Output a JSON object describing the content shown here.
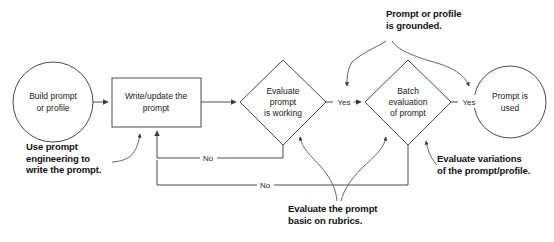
{
  "diagram": {
    "nodes": {
      "start": "Build prompt\nor profile",
      "start_line1": "Build prompt",
      "start_line2": "or profile",
      "write": "Write/update the\nprompt",
      "write_line1": "Write/update the",
      "write_line2": "prompt",
      "eval1_line1": "Evaluate",
      "eval1_line2": "prompt",
      "eval1_line3": "is working",
      "eval2_line1": "Batch",
      "eval2_line2": "evaluation",
      "eval2_line3": "of prompt",
      "end_line1": "Prompt is",
      "end_line2": "used"
    },
    "edge_labels": {
      "yes1": "Yes",
      "yes2": "Yes",
      "no1": "No",
      "no2": "No"
    },
    "callouts": {
      "prompt_engineering_line1": "Use prompt",
      "prompt_engineering_line2": "engineering to",
      "prompt_engineering_line3": "write the prompt.",
      "grounded_line1": "Prompt or profile",
      "grounded_line2": "is grounded.",
      "rubrics_line1": "Evaluate the prompt",
      "rubrics_line2": "basic on rubrics.",
      "variations_line1": "Evaluate variations",
      "variations_line2": "of the prompt/profile."
    },
    "colors": {
      "background": "#ffffff",
      "stroke": "#4a4a4a",
      "text": "#1a1a1a",
      "callout_text": "#111111"
    }
  }
}
